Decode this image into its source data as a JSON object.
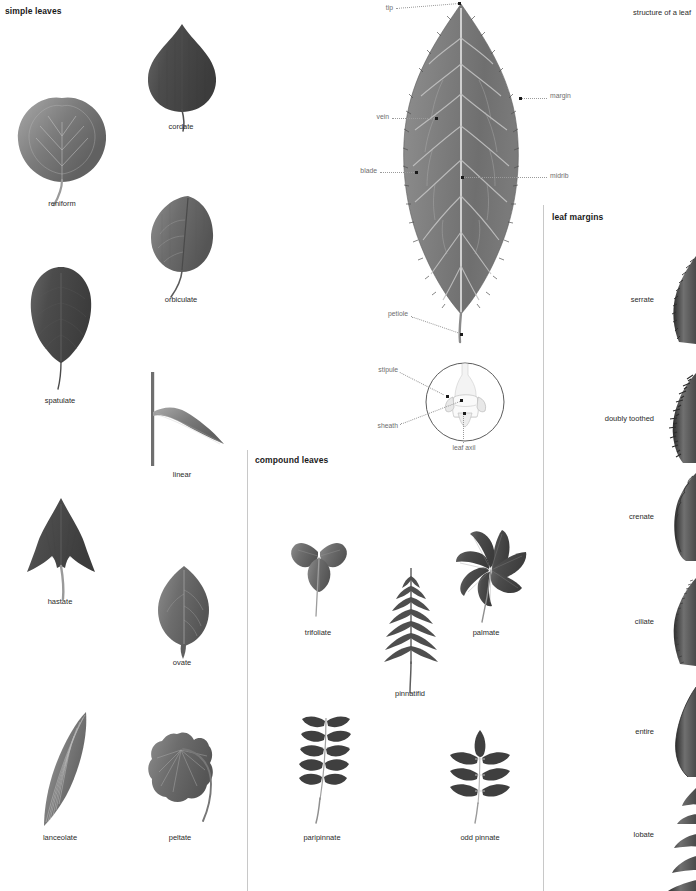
{
  "headings": {
    "simple_leaves": "simple leaves",
    "compound_leaves": "compound leaves",
    "leaf_margins": "leaf margins",
    "structure_of_a_leaf": "structure of a leaf"
  },
  "simple_leaves": [
    {
      "label": "reniform",
      "cx": 62,
      "cy": 135,
      "caption_y": 203
    },
    {
      "label": "cordate",
      "cx": 181,
      "cy": 70,
      "caption_y": 126
    },
    {
      "label": "orbiculate",
      "cx": 181,
      "cy": 232,
      "caption_y": 299
    },
    {
      "label": "spatulate",
      "cx": 60,
      "cy": 318,
      "caption_y": 400
    },
    {
      "label": "linear",
      "cx": 182,
      "cy": 415,
      "caption_y": 474
    },
    {
      "label": "hastate",
      "cx": 60,
      "cy": 548,
      "caption_y": 601
    },
    {
      "label": "ovate",
      "cx": 182,
      "cy": 603,
      "caption_y": 662
    },
    {
      "label": "lanceolate",
      "cx": 60,
      "cy": 770,
      "caption_y": 837
    },
    {
      "label": "peltate",
      "cx": 180,
      "cy": 773,
      "caption_y": 837
    }
  ],
  "compound_leaves": [
    {
      "label": "trifoliate",
      "cx": 318,
      "cy": 555,
      "caption_y": 632
    },
    {
      "label": "pinnatifid",
      "cx": 410,
      "cy": 620,
      "caption_y": 693
    },
    {
      "label": "palmate",
      "cx": 486,
      "cy": 570,
      "caption_y": 632
    },
    {
      "label": "paripinnate",
      "cx": 322,
      "cy": 768,
      "caption_y": 837
    },
    {
      "label": "odd pinnate",
      "cx": 480,
      "cy": 768,
      "caption_y": 837
    }
  ],
  "leaf_margins": [
    {
      "label": "serrate",
      "label_x": 660,
      "label_y": 299,
      "cy": 300
    },
    {
      "label": "doubly toothed",
      "label_x": 660,
      "label_y": 418,
      "cy": 418
    },
    {
      "label": "crenate",
      "label_x": 660,
      "label_y": 516,
      "cy": 517
    },
    {
      "label": "ciliate",
      "label_x": 660,
      "label_y": 621,
      "cy": 622
    },
    {
      "label": "entire",
      "label_x": 660,
      "label_y": 731,
      "cy": 732
    },
    {
      "label": "lobate",
      "label_x": 660,
      "label_y": 834,
      "cy": 835
    }
  ],
  "leaf_anatomy": {
    "callouts": [
      {
        "name": "tip",
        "text": "tip",
        "label_x": 383,
        "label_y": 9,
        "dot_x": 459,
        "dot_y": 3,
        "align": "r"
      },
      {
        "name": "margin",
        "text": "margin",
        "label_x": 549,
        "label_y": 96,
        "dot_x": 521,
        "dot_y": 99,
        "align": "l"
      },
      {
        "name": "vein",
        "text": "vein",
        "label_x": 379,
        "label_y": 117,
        "dot_x": 436,
        "dot_y": 119,
        "align": "r"
      },
      {
        "name": "blade",
        "text": "blade",
        "label_x": 377,
        "label_y": 171,
        "dot_x": 416,
        "dot_y": 173,
        "align": "r"
      },
      {
        "name": "midrib",
        "text": "midrib",
        "label_x": 549,
        "label_y": 176,
        "dot_x": 462,
        "dot_y": 178,
        "align": "l"
      },
      {
        "name": "petiole",
        "text": "petiole",
        "label_x": 408,
        "label_y": 313,
        "dot_x": 461,
        "dot_y": 334,
        "align": "r"
      },
      {
        "name": "stipule",
        "text": "stipule",
        "label_x": 398,
        "label_y": 369,
        "dot_x": 447,
        "dot_y": 396,
        "align": "r"
      },
      {
        "name": "sheath",
        "text": "sheath",
        "label_x": 398,
        "label_y": 425,
        "dot_x": 461,
        "dot_y": 400,
        "align": "r"
      },
      {
        "name": "leaf axil",
        "text": "leaf axil",
        "label_x": 464,
        "label_y": 447,
        "dot_x": 464,
        "dot_y": 413,
        "align": "c"
      }
    ]
  },
  "colors": {
    "leaf_dark": "#4a4a4a",
    "leaf_mid": "#6b6b6b",
    "leaf_light": "#8e8e8e",
    "stem": "#8c8c8c",
    "divider": "#c8c8c8",
    "label_gray": "#6e6e6e",
    "text": "#2b2b2b",
    "background": "#ffffff"
  }
}
